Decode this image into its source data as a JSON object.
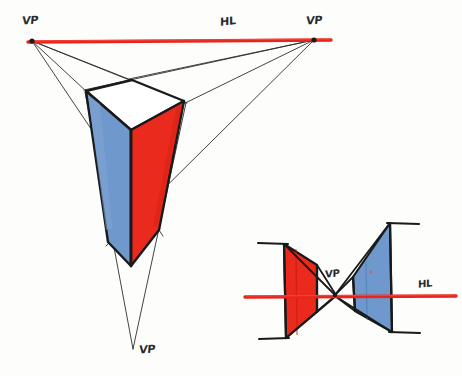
{
  "colors": {
    "red_fill": "#ea2a1c",
    "red_fill_dark": "#d41f14",
    "blue_fill": "#6f98cc",
    "blue_fill_dark": "#5d87bd",
    "horizon_red": "#e8241b",
    "ink": "#1a1a1a",
    "thin_ink": "#2e2e2e",
    "paper": "#fdfdfc",
    "white_face": "#ffffff"
  },
  "labels": {
    "vp_top_left": "VP",
    "horizon_main": "HL",
    "vp_top_right": "VP",
    "vp_bottom": "VP",
    "vp_small": "VP",
    "horizon_small": "HL"
  },
  "label_positions": {
    "vp_top_left": {
      "x": 22,
      "y": 14
    },
    "horizon_main": {
      "x": 220,
      "y": 15
    },
    "vp_top_right": {
      "x": 306,
      "y": 14
    },
    "vp_bottom": {
      "x": 139,
      "y": 343
    },
    "vp_small": {
      "x": 325,
      "y": 268
    },
    "horizon_small": {
      "x": 418,
      "y": 278
    }
  },
  "main_figure": {
    "name": "three-point-perspective-prism",
    "vanishing_points": {
      "left": {
        "x": 32,
        "y": 41
      },
      "right": {
        "x": 314,
        "y": 40
      },
      "bottom": {
        "x": 133,
        "y": 349
      }
    },
    "horizon_line": {
      "x1": 28,
      "y1": 42,
      "x2": 331,
      "y2": 40
    },
    "prism_vertices": {
      "top_back": {
        "x": 132,
        "y": 80
      },
      "top_left": {
        "x": 86,
        "y": 91
      },
      "top_front": {
        "x": 131,
        "y": 130
      },
      "top_right": {
        "x": 184,
        "y": 101
      },
      "bottom_apex": {
        "x": 131,
        "y": 266
      },
      "left_low": {
        "x": 108,
        "y": 242
      },
      "right_low": {
        "x": 159,
        "y": 230
      }
    },
    "faces": [
      {
        "name": "top-face",
        "fill": "#ffffff"
      },
      {
        "name": "left-face",
        "fill": "#6f98cc"
      },
      {
        "name": "right-face",
        "fill": "#ea2a1c"
      }
    ]
  },
  "small_figure": {
    "name": "two-plane-vanishing-point-diagram",
    "vanishing_point": {
      "x": 335,
      "y": 295
    },
    "horizon_line": {
      "x1": 245,
      "y1": 297,
      "x2": 456,
      "y2": 296
    },
    "red_plane": {
      "fill": "#ea2a1c",
      "points": [
        {
          "x": 284,
          "y": 244
        },
        {
          "x": 317,
          "y": 265
        },
        {
          "x": 317,
          "y": 312
        },
        {
          "x": 286,
          "y": 338
        }
      ]
    },
    "blue_plane": {
      "fill": "#6f98cc",
      "points": [
        {
          "x": 390,
          "y": 223
        },
        {
          "x": 353,
          "y": 277
        },
        {
          "x": 355,
          "y": 311
        },
        {
          "x": 392,
          "y": 332
        }
      ]
    },
    "tick_marks": [
      {
        "name": "tick-red-top",
        "x1": 258,
        "y1": 243,
        "x2": 288,
        "y2": 244
      },
      {
        "name": "tick-red-bottom",
        "x1": 259,
        "y1": 339,
        "x2": 289,
        "y2": 338
      },
      {
        "name": "tick-blue-top",
        "x1": 387,
        "y1": 223,
        "x2": 418,
        "y2": 224
      },
      {
        "name": "tick-blue-bottom",
        "x1": 389,
        "y1": 332,
        "x2": 419,
        "y2": 333
      }
    ]
  },
  "construction_lines_main": [
    {
      "name": "vpl-to-top-back",
      "from": "left",
      "to": {
        "x": 132,
        "y": 80
      }
    },
    {
      "name": "vpl-to-top-left",
      "from": "left",
      "to": {
        "x": 86,
        "y": 91
      }
    },
    {
      "name": "vpl-to-top-right",
      "from": "left",
      "to": {
        "x": 184,
        "y": 101
      }
    },
    {
      "name": "vpl-to-right-low",
      "from": "left",
      "to": {
        "x": 159,
        "y": 230
      }
    },
    {
      "name": "vpr-to-top-back",
      "from": "right",
      "to": {
        "x": 132,
        "y": 80
      }
    },
    {
      "name": "vpr-to-top-left",
      "from": "right",
      "to": {
        "x": 86,
        "y": 91
      }
    },
    {
      "name": "vpr-to-top-front",
      "from": "right",
      "to": {
        "x": 131,
        "y": 130
      }
    },
    {
      "name": "vpr-to-left-low",
      "from": "right",
      "to": {
        "x": 108,
        "y": 242
      }
    },
    {
      "name": "vpb-to-top-left",
      "from": "bottom",
      "to": {
        "x": 86,
        "y": 91
      }
    },
    {
      "name": "vpb-to-top-right",
      "from": "bottom",
      "to": {
        "x": 184,
        "y": 101
      }
    }
  ]
}
